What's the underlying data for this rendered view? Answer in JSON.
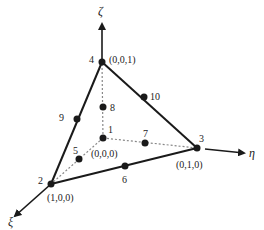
{
  "diagram": {
    "type": "10-node quadratic tetrahedral element (natural coordinates)",
    "axes": {
      "zeta": {
        "label": "ζ",
        "direction": "up"
      },
      "eta": {
        "label": "η",
        "direction": "right"
      },
      "xi": {
        "label": "ξ",
        "direction": "down-left"
      }
    },
    "nodes": [
      {
        "id": "1",
        "label": "1",
        "coord": "(0,0,0)",
        "type": "vertex"
      },
      {
        "id": "2",
        "label": "2",
        "coord": "(1,0,0)",
        "type": "vertex"
      },
      {
        "id": "3",
        "label": "3",
        "coord": "(0,1,0)",
        "type": "vertex"
      },
      {
        "id": "4",
        "label": "4",
        "coord": "(0,0,1)",
        "type": "vertex"
      },
      {
        "id": "5",
        "label": "5",
        "type": "midside"
      },
      {
        "id": "6",
        "label": "6",
        "type": "midside"
      },
      {
        "id": "7",
        "label": "7",
        "type": "midside"
      },
      {
        "id": "8",
        "label": "8",
        "type": "midside"
      },
      {
        "id": "9",
        "label": "9",
        "type": "midside"
      },
      {
        "id": "10",
        "label": "10",
        "type": "midside"
      }
    ],
    "edges": [
      {
        "from": "4",
        "to": "2",
        "style": "solid",
        "mid": "9"
      },
      {
        "from": "4",
        "to": "3",
        "style": "solid",
        "mid": "10"
      },
      {
        "from": "2",
        "to": "3",
        "style": "solid",
        "mid": "6"
      },
      {
        "from": "1",
        "to": "4",
        "style": "dotted",
        "mid": "8"
      },
      {
        "from": "1",
        "to": "3",
        "style": "dotted",
        "mid": "7"
      },
      {
        "from": "1",
        "to": "2",
        "style": "dotted",
        "mid": "5"
      }
    ],
    "colors": {
      "line": "#1a1a1a",
      "dotted": "#888888",
      "background": "#ffffff"
    }
  }
}
